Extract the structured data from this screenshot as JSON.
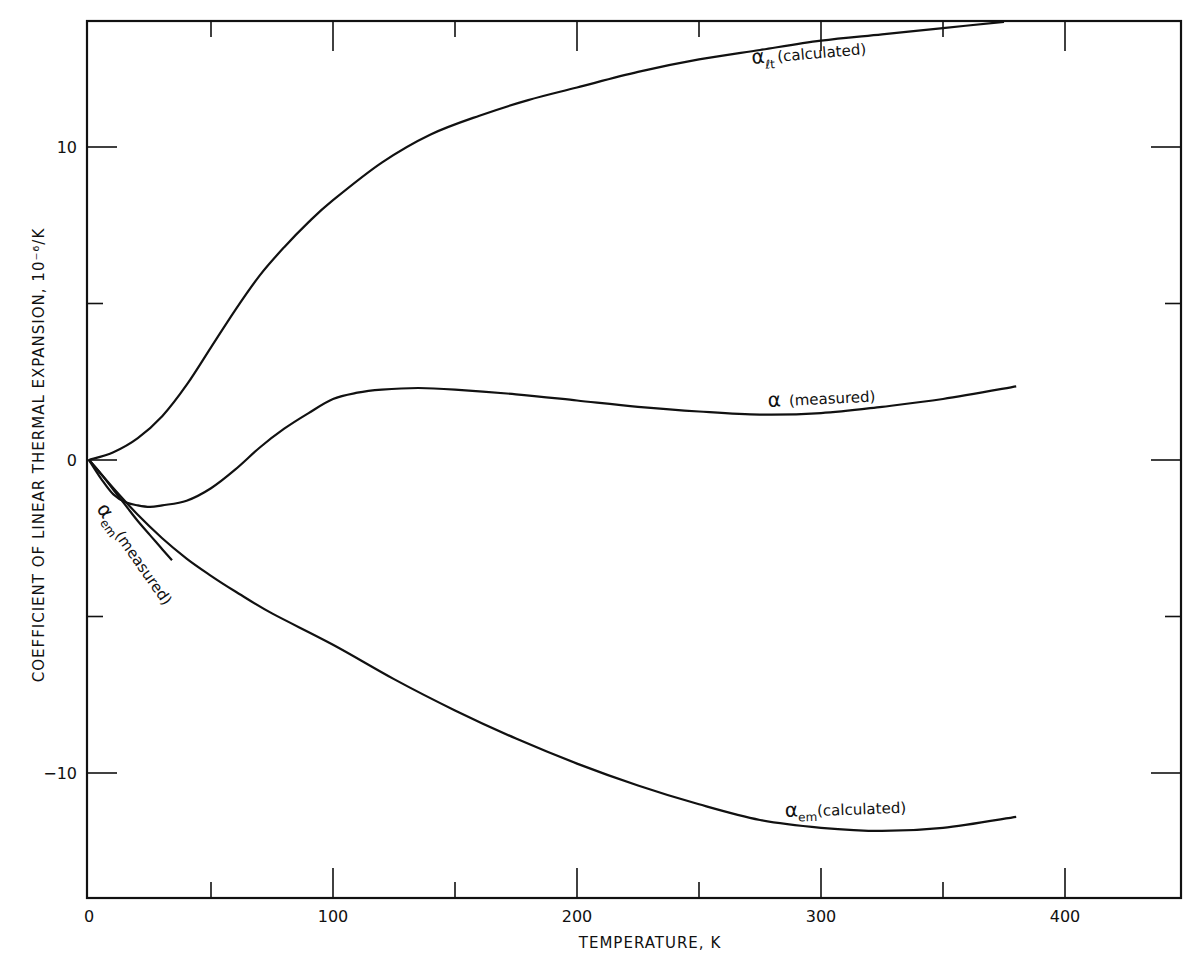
{
  "chart_data": {
    "type": "line",
    "title": "",
    "xlabel": "TEMPERATURE, K",
    "ylabel": "COEFFICIENT OF LINEAR THERMAL EXPANSION, 10⁻⁶/K",
    "xlim": [
      0,
      450
    ],
    "ylim": [
      -14,
      14
    ],
    "x_ticks": [
      0,
      50,
      100,
      150,
      200,
      250,
      300,
      350,
      400
    ],
    "x_tick_labels": [
      "0",
      "",
      "100",
      "",
      "200",
      "",
      "300",
      "",
      "400"
    ],
    "y_ticks": [
      -10,
      -5,
      0,
      5,
      10
    ],
    "y_tick_labels": [
      "-10",
      "",
      "0",
      "",
      "10"
    ],
    "grid": false,
    "legend": "none (curves labeled inline)",
    "series": [
      {
        "name": "α_lt (calculated)",
        "label_main": "α",
        "label_sub": "ℓt",
        "label_rest": "(calculated)",
        "x": [
          0,
          10,
          20,
          30,
          40,
          50,
          60,
          70,
          80,
          90,
          100,
          120,
          140,
          160,
          180,
          200,
          225,
          250,
          275,
          300,
          325,
          350,
          375
        ],
        "y": [
          0,
          0.25,
          0.7,
          1.4,
          2.4,
          3.6,
          4.8,
          5.9,
          6.8,
          7.6,
          8.3,
          9.5,
          10.4,
          11.0,
          11.5,
          11.9,
          12.4,
          12.8,
          13.1,
          13.4,
          13.6,
          13.8,
          14.0
        ]
      },
      {
        "name": "α (measured)",
        "label_main": "α",
        "label_sub": "",
        "label_rest": "(measured)",
        "x": [
          0,
          5,
          10,
          15,
          20,
          25,
          30,
          40,
          50,
          60,
          70,
          80,
          90,
          100,
          110,
          120,
          135,
          150,
          175,
          200,
          225,
          250,
          275,
          300,
          325,
          350,
          380
        ],
        "y": [
          0,
          -0.6,
          -1.1,
          -1.35,
          -1.45,
          -1.5,
          -1.45,
          -1.3,
          -0.9,
          -0.3,
          0.4,
          1.0,
          1.5,
          1.95,
          2.15,
          2.25,
          2.3,
          2.25,
          2.1,
          1.9,
          1.7,
          1.55,
          1.45,
          1.5,
          1.7,
          1.95,
          2.35
        ]
      },
      {
        "name": "α_em (measured)",
        "label_main": "α",
        "label_sub": "em",
        "label_rest": "(measured)",
        "x": [
          0,
          5,
          10,
          15,
          20,
          25,
          30,
          34
        ],
        "y": [
          0,
          -0.45,
          -0.95,
          -1.45,
          -1.95,
          -2.4,
          -2.85,
          -3.2
        ]
      },
      {
        "name": "α_em (calculated)",
        "label_main": "α",
        "label_sub": "em",
        "label_rest": "(calculated)",
        "x": [
          0,
          10,
          20,
          30,
          40,
          50,
          60,
          75,
          100,
          125,
          150,
          175,
          200,
          225,
          250,
          275,
          300,
          325,
          350,
          380
        ],
        "y": [
          0,
          -0.9,
          -1.75,
          -2.5,
          -3.15,
          -3.7,
          -4.2,
          -4.9,
          -5.9,
          -7.0,
          -8.0,
          -8.9,
          -9.7,
          -10.4,
          -11.0,
          -11.5,
          -11.75,
          -11.85,
          -11.75,
          -11.4
        ]
      }
    ]
  }
}
